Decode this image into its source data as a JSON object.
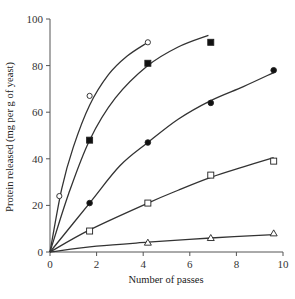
{
  "chart_data": {
    "type": "line",
    "title": "",
    "xlabel": "Number of passes",
    "ylabel": "Protein released (mg per g of yeast)",
    "xlim": [
      0,
      10
    ],
    "ylim": [
      0,
      100
    ],
    "xticks": [
      0,
      2,
      4,
      6,
      8,
      10
    ],
    "yticks": [
      0,
      20,
      40,
      60,
      80,
      100
    ],
    "grid": false,
    "legend": null,
    "series": [
      {
        "name": "open-circle",
        "marker": "open-circle",
        "points": [
          [
            0.4,
            24
          ],
          [
            1.7,
            67
          ],
          [
            4.2,
            90
          ]
        ],
        "curve": [
          [
            0,
            0
          ],
          [
            0.5,
            27
          ],
          [
            1,
            45
          ],
          [
            1.7,
            63
          ],
          [
            2.5,
            76
          ],
          [
            3.3,
            84
          ],
          [
            4.2,
            90
          ]
        ]
      },
      {
        "name": "filled-square",
        "marker": "filled-square",
        "points": [
          [
            1.7,
            48
          ],
          [
            4.2,
            81
          ],
          [
            6.9,
            90
          ]
        ],
        "curve": [
          [
            0,
            0
          ],
          [
            0.8,
            25
          ],
          [
            1.7,
            48
          ],
          [
            2.8,
            66
          ],
          [
            4.2,
            80
          ],
          [
            5.5,
            88
          ],
          [
            6.8,
            93
          ]
        ]
      },
      {
        "name": "filled-circle",
        "marker": "filled-circle",
        "points": [
          [
            1.7,
            21
          ],
          [
            4.2,
            47
          ],
          [
            6.9,
            64
          ],
          [
            9.6,
            78
          ]
        ],
        "curve": [
          [
            0,
            0
          ],
          [
            1.7,
            21
          ],
          [
            3,
            37
          ],
          [
            4.2,
            47
          ],
          [
            5.5,
            57
          ],
          [
            6.9,
            65
          ],
          [
            8.3,
            71
          ],
          [
            9.6,
            77
          ]
        ]
      },
      {
        "name": "open-square",
        "marker": "open-square",
        "points": [
          [
            1.7,
            9
          ],
          [
            4.2,
            21
          ],
          [
            6.9,
            33
          ],
          [
            9.6,
            39
          ]
        ],
        "curve": [
          [
            0,
            0
          ],
          [
            1.7,
            9.5
          ],
          [
            4.2,
            21
          ],
          [
            5.5,
            26.5
          ],
          [
            6.9,
            32
          ],
          [
            8.3,
            36.5
          ],
          [
            9.6,
            40.5
          ]
        ]
      },
      {
        "name": "open-triangle",
        "marker": "open-triangle",
        "points": [
          [
            4.2,
            4
          ],
          [
            6.9,
            6
          ],
          [
            9.6,
            8
          ]
        ],
        "curve": [
          [
            0,
            0
          ],
          [
            2,
            2.5
          ],
          [
            4.2,
            4.2
          ],
          [
            6.9,
            6
          ],
          [
            9.6,
            7.5
          ]
        ]
      }
    ]
  }
}
